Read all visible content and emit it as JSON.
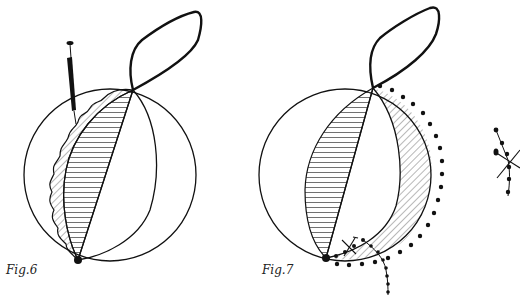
{
  "figures": [
    {
      "id": "fig6",
      "caption": "Fig.6",
      "elements": [
        "sphere-outline",
        "meridian-arc",
        "chord-line",
        "horizontal-hatched-lune",
        "wavy-diagonal-hatched-border",
        "syringe",
        "top-loop",
        "bottom-point"
      ]
    },
    {
      "id": "fig7",
      "caption": "Fig.7",
      "elements": [
        "sphere-outline",
        "meridian-arc",
        "chord-line",
        "horizontal-hatched-lune",
        "diagonal-hatched-crescent",
        "dotted-suture-outline",
        "dotted-suture-branch",
        "cross-mark",
        "top-loop",
        "bottom-point"
      ]
    },
    {
      "id": "fig8-partial",
      "caption": "",
      "elements": [
        "dotted-suture-branch",
        "cross-mark"
      ]
    }
  ],
  "colors": {
    "ink": "#111111",
    "background": "#ffffff"
  }
}
